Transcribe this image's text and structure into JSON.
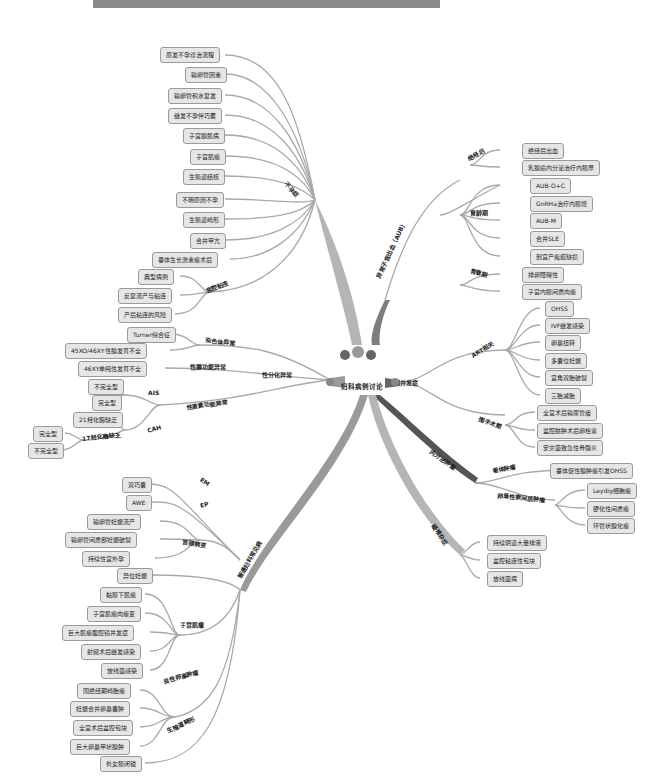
{
  "title_banner": "",
  "center": {
    "label": "妇科病例讨论"
  },
  "colors": {
    "branch_gray": "#a9a9a9",
    "branch_dark": "#555555",
    "branch_mid": "#7d7d7d",
    "node_bg": "#e6e6e6",
    "node_border": "#9a9a9a",
    "line": "#9a9a9a"
  },
  "branches": {
    "infertility": {
      "label": "不孕症",
      "items": [
        "原发不孕诊治流程",
        "输卵管因素",
        "输卵管积水复发",
        "继发不孕伴巧蓄",
        "子宫腺肌病",
        "子宫肌瘤",
        "生殖道结核",
        "不明原因不孕",
        "生殖道畸形",
        "合并甲亢",
        "垂体生长激素瘤术后"
      ],
      "uterine_adhesion": {
        "label": "宫腔粘连",
        "items": [
          "典型病例",
          "反复流产与粘连",
          "产后粘连的风险"
        ]
      }
    },
    "dsd": {
      "label": "性分化异常",
      "chromosome": {
        "label": "染色体异常",
        "items": [
          "Turner综合征",
          "45XO/46XY性腺发育不全"
        ]
      },
      "gonad": {
        "label": "性腺功能异常",
        "items": [
          "46XY单纯性发育不全"
        ]
      },
      "hormone": {
        "label": "性激素功能异常",
        "ais": {
          "label": "AIS",
          "items": [
            "不完全型",
            "完全型"
          ]
        },
        "cah": {
          "label": "CAH",
          "items": [
            "21羟化酶缺乏"
          ],
          "h17": {
            "label": "17羟化酶缺乏",
            "items": [
              "完全型",
              "不完全型"
            ]
          }
        }
      }
    },
    "common": {
      "label": "普通妇科常见病",
      "em": {
        "label": "EM",
        "items": [
          "双巧囊",
          "AWE"
        ]
      },
      "ep": {
        "label": "EP",
        "items": [
          "输卵管妊娠流产",
          "输卵管间质部妊娠破裂",
          "持续性宫外孕"
        ]
      },
      "cervix": {
        "label": "宫颈病变",
        "items": [
          "异位妊娠"
        ]
      },
      "fibroid": {
        "label": "子宫肌瘤",
        "items": [
          "黏膜下肌瘤",
          "子宫肌瘤肉瘤变",
          "巨大肌瘤腹腔镜并发症",
          "射频术后继发感染",
          "放线菌感染"
        ]
      },
      "ovarian_benign": {
        "label": "良性卵巢肿瘤",
        "items": [
          "围绝经期畸胎瘤",
          "妊娠合并卵巢囊肿",
          "全宫术后盆腔包块",
          "巨大卵巢甲状腺肿"
        ]
      },
      "malformation": {
        "label": "生殖道畸形",
        "items": [
          "处女膜闭锁"
        ]
      }
    },
    "aub": {
      "label": "异常子宫出血（AUB）",
      "postmeno": {
        "label": "绝经后",
        "items": [
          "绝经后出血",
          "乳腺癌内分泌治疗内膜厚"
        ]
      },
      "reproductive": {
        "label": "育龄期",
        "items": [
          "AUB-O+C",
          "GnRHa治疗内膜增",
          "AUB-M",
          "合并SLE",
          "剖宫产瘢痕缺损"
        ]
      },
      "adolescent": {
        "label": "青春期",
        "items": [
          "排卵障碍性",
          "子宫内膜间质肉瘤"
        ]
      }
    },
    "complication": {
      "label": "并发症",
      "art": {
        "label": "ART相关",
        "items": [
          "OHSS",
          "IVF继发感染",
          "卵巢扭转",
          "多囊位妊娠",
          "宫角双胎破裂",
          "三胎减胎"
        ]
      },
      "surgery": {
        "label": "围手术期",
        "items": [
          "全宫术后输尿管瘘",
          "盆腔脓肿术后卵栓塞",
          "安灾菌致急性骨髓炎"
        ]
      }
    },
    "endocrine_tumor": {
      "label": "内分泌肿瘤",
      "pituitary": {
        "label": "垂体肿瘤",
        "items": [
          "垂体促性腺肿瘤引发OHSS"
        ]
      },
      "sex_cord": {
        "label": "卵巢性索间质肿瘤",
        "items": [
          "Leydig细胞瘤",
          "硬化性间质瘤",
          "环管状腺化瘤"
        ]
      }
    },
    "rare": {
      "label": "疑难杂症",
      "items": [
        "持续阴道大量排液",
        "盆腔粘连性包块",
        "放线菌病"
      ]
    }
  }
}
